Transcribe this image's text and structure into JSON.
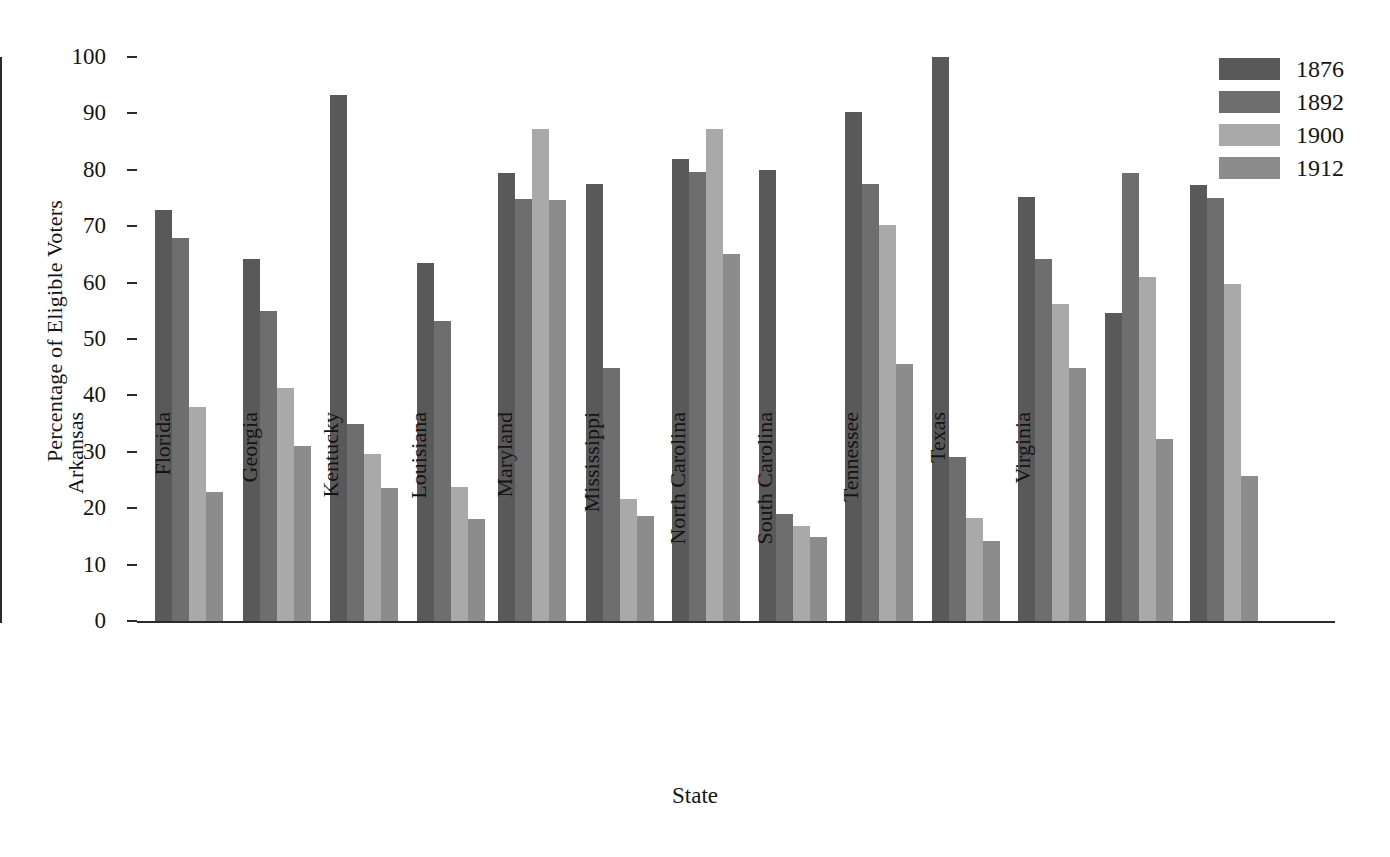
{
  "chart_data": {
    "type": "bar",
    "title": "",
    "xlabel": "State",
    "ylabel": "Percentage of Eligible Voters",
    "ylim": [
      0,
      100
    ],
    "yticks": [
      0,
      10,
      20,
      30,
      40,
      50,
      60,
      70,
      80,
      90,
      100
    ],
    "grid": false,
    "legend_position": "top-right",
    "categories": [
      "Alabama",
      "Arkansas",
      "Florida",
      "Georgia",
      "Kentucky",
      "Louisiana",
      "Maryland",
      "Mississippi",
      "North Carolina",
      "South Carolina",
      "Tennessee",
      "Texas",
      "Virginia"
    ],
    "series": [
      {
        "name": "1876",
        "color": "#595959",
        "values": [
          72.8,
          64.2,
          93.2,
          63.4,
          79.5,
          77.4,
          82.0,
          79.9,
          90.3,
          100.0,
          75.1,
          54.6,
          77.3
        ]
      },
      {
        "name": "1892",
        "color": "#6e6e6e",
        "values": [
          67.9,
          55.0,
          35.0,
          53.2,
          74.8,
          44.8,
          79.6,
          18.9,
          77.5,
          29.0,
          64.1,
          79.5,
          75.0
        ]
      },
      {
        "name": "1900",
        "color": "#a9a9a9",
        "values": [
          38.0,
          41.3,
          29.7,
          23.7,
          87.3,
          21.7,
          87.2,
          16.9,
          70.3,
          18.2,
          56.2,
          61.0,
          59.8
        ]
      },
      {
        "name": "1912",
        "color": "#8c8c8c",
        "values": [
          22.9,
          31.0,
          23.6,
          18.0,
          74.7,
          18.7,
          65.0,
          14.9,
          45.5,
          14.1,
          44.8,
          32.3,
          25.7
        ]
      }
    ]
  },
  "legend": {
    "entries": [
      {
        "label": "1876",
        "color": "#595959"
      },
      {
        "label": "1892",
        "color": "#6e6e6e"
      },
      {
        "label": "1900",
        "color": "#a9a9a9"
      },
      {
        "label": "1912",
        "color": "#8c8c8c"
      }
    ]
  },
  "axes": {
    "y_title": "Percentage of Eligible Voters",
    "x_title": "State"
  }
}
